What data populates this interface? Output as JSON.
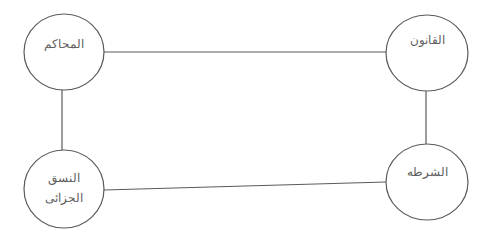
{
  "diagram": {
    "type": "network",
    "stroke_color": "#5a5a5a",
    "text_color": "#5e5e5e",
    "nodes": [
      {
        "id": "courts",
        "lines": [
          "المحاكم"
        ],
        "cx": 64,
        "cy": 52,
        "rx": 40,
        "ry": 38,
        "text_y": 48
      },
      {
        "id": "law",
        "lines": [
          "القانون"
        ],
        "cx": 427,
        "cy": 53,
        "rx": 41,
        "ry": 38,
        "text_y": 44
      },
      {
        "id": "criminal-system",
        "lines": [
          "النسق",
          "الجزائى"
        ],
        "cx": 64,
        "cy": 189,
        "rx": 40,
        "ry": 39,
        "text_y": 182
      },
      {
        "id": "police",
        "lines": [
          "الشرطه"
        ],
        "cx": 427,
        "cy": 182,
        "rx": 41,
        "ry": 38,
        "text_y": 176
      }
    ],
    "edges": [
      {
        "from": "courts",
        "to": "law",
        "x1": 104,
        "y1": 52,
        "x2": 386,
        "y2": 52
      },
      {
        "from": "courts",
        "to": "criminal-system",
        "x1": 62,
        "y1": 90,
        "x2": 62,
        "y2": 150
      },
      {
        "from": "law",
        "to": "police",
        "x1": 426,
        "y1": 91,
        "x2": 426,
        "y2": 144
      },
      {
        "from": "criminal-system",
        "to": "police",
        "x1": 104,
        "y1": 190,
        "x2": 386,
        "y2": 182
      }
    ]
  }
}
